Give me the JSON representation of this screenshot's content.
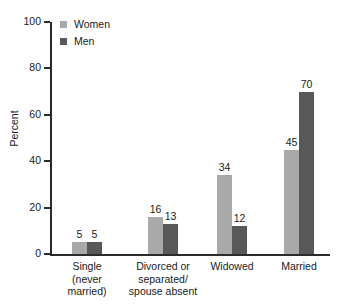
{
  "chart_data": {
    "type": "bar",
    "title": "",
    "subtitle": "",
    "xlabel": "",
    "ylabel": "Percent",
    "ylim": [
      0,
      100
    ],
    "yticks": [
      0,
      20,
      40,
      60,
      80,
      100
    ],
    "grid": false,
    "legend_position": "top-left",
    "categories": [
      "Single\n(never\nmarried)",
      "Divorced or\nseparated/\nspouse absent",
      "Widowed",
      "Married"
    ],
    "series": [
      {
        "name": "Women",
        "color": "#a9a9a9",
        "values": [
          5,
          16,
          34,
          45
        ]
      },
      {
        "name": "Men",
        "color": "#585858",
        "values": [
          5,
          13,
          12,
          70
        ]
      }
    ]
  },
  "axis": {
    "y_tick_labels": [
      "100",
      "80",
      "60",
      "40",
      "20",
      "0"
    ],
    "y_axis_title": "Percent"
  },
  "legend": {
    "entries": [
      {
        "label": "Women",
        "color": "#a9a9a9"
      },
      {
        "label": "Men",
        "color": "#585858"
      }
    ]
  },
  "colors": {
    "women_bar": "#a9a9a9",
    "men_bar": "#585858",
    "axis": "#2b2b2b",
    "text": "#1a1a1a",
    "background": "#ffffff"
  }
}
